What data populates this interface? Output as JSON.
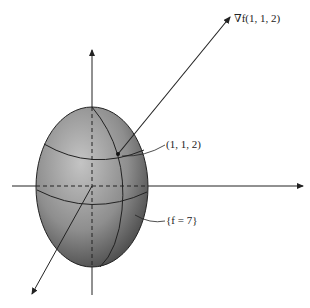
{
  "figure": {
    "surface_label": "{f = 7}",
    "point_label": "(1, 1, 2)",
    "gradient_label": "∇f(1, 1, 2)",
    "colors": {
      "surface_light": "#b5b5b5",
      "surface_dark": "#5a5a5a",
      "stroke": "#222222",
      "background": "#ffffff"
    }
  }
}
